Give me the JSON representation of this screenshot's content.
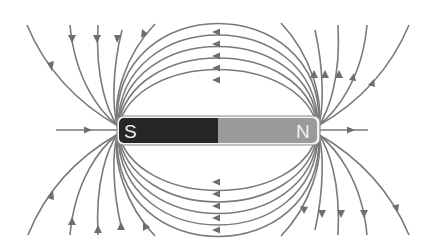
{
  "diagram": {
    "magnet": {
      "south_label": "S",
      "north_label": "N",
      "south_color": "#262626",
      "north_color": "#9a9a9a",
      "outline_color": "#8a8a8a"
    },
    "field_line_color": "#7a7a7a",
    "field_line_direction": "out of N, into S",
    "loops_above": 5,
    "loops_below": 5,
    "open_lines_per_quadrant": 5,
    "axial_lines": 2
  }
}
